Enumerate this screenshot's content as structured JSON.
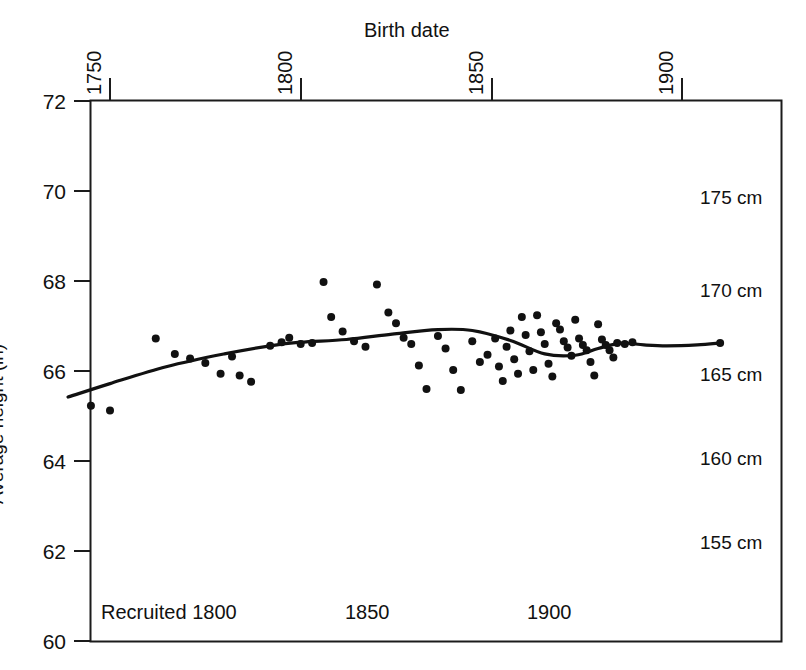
{
  "figure": {
    "background": "#ffffff",
    "ink_color": "#111111",
    "width": 806,
    "height": 670
  },
  "axes": {
    "top_axis_title": "Birth date",
    "left_axis_title": "Average height (in)",
    "x_ticks": [
      "1750",
      "1800",
      "1850",
      "1900"
    ],
    "y_ticks": [
      "72",
      "70",
      "68",
      "66",
      "64",
      "62",
      "60"
    ],
    "right_cm_labels": [
      "175 cm",
      "170 cm",
      "165 cm",
      "160 cm",
      "155 cm"
    ],
    "bottom_recruit_labels": [
      "Recruited 1800",
      "1850",
      "1900"
    ]
  },
  "chart_data": {
    "type": "scatter",
    "title": "Birth date",
    "xlabel": "Birth date",
    "ylabel": "Average height (in)",
    "xlim": [
      1738,
      1914
    ],
    "ylim": [
      60,
      72
    ],
    "grid": false,
    "legend": null,
    "x_tick_values": [
      1750,
      1800,
      1850,
      1900
    ],
    "y_tick_values": [
      60,
      62,
      64,
      66,
      68,
      70,
      72
    ],
    "secondary_y_axis": {
      "label_suffix": "cm",
      "tick_values_cm": [
        175,
        170,
        165,
        160,
        155
      ],
      "tick_values_in": [
        68.9,
        66.93,
        64.96,
        62.99,
        61.02
      ]
    },
    "secondary_x_axis": {
      "name": "Recruited",
      "tick_values": [
        1800,
        1850,
        1900
      ],
      "tick_labels": [
        "Recruited 1800",
        "1850",
        "1900"
      ]
    },
    "series": [
      {
        "name": "Average height observations",
        "type": "scatter",
        "marker": "filled-circle",
        "points": [
          [
            1745,
            65.23
          ],
          [
            1750,
            65.12
          ],
          [
            1762,
            66.72
          ],
          [
            1767,
            66.38
          ],
          [
            1771,
            66.28
          ],
          [
            1775,
            66.18
          ],
          [
            1779,
            65.94
          ],
          [
            1782,
            66.32
          ],
          [
            1784,
            65.9
          ],
          [
            1787,
            65.76
          ],
          [
            1792,
            66.56
          ],
          [
            1795,
            66.64
          ],
          [
            1797,
            66.74
          ],
          [
            1800,
            66.6
          ],
          [
            1803,
            66.62
          ],
          [
            1806,
            67.98
          ],
          [
            1808,
            67.2
          ],
          [
            1811,
            66.88
          ],
          [
            1814,
            66.66
          ],
          [
            1817,
            66.54
          ],
          [
            1820,
            67.92
          ],
          [
            1823,
            67.3
          ],
          [
            1825,
            67.06
          ],
          [
            1827,
            66.74
          ],
          [
            1829,
            66.6
          ],
          [
            1831,
            66.12
          ],
          [
            1833,
            65.6
          ],
          [
            1836,
            66.78
          ],
          [
            1838,
            66.5
          ],
          [
            1840,
            66.02
          ],
          [
            1842,
            65.58
          ],
          [
            1845,
            66.66
          ],
          [
            1847,
            66.2
          ],
          [
            1849,
            66.36
          ],
          [
            1851,
            66.72
          ],
          [
            1852,
            66.1
          ],
          [
            1853,
            65.78
          ],
          [
            1854,
            66.54
          ],
          [
            1855,
            66.9
          ],
          [
            1856,
            66.26
          ],
          [
            1857,
            65.94
          ],
          [
            1858,
            67.2
          ],
          [
            1859,
            66.8
          ],
          [
            1860,
            66.44
          ],
          [
            1861,
            66.02
          ],
          [
            1862,
            67.24
          ],
          [
            1863,
            66.86
          ],
          [
            1864,
            66.6
          ],
          [
            1865,
            66.16
          ],
          [
            1866,
            65.88
          ],
          [
            1867,
            67.06
          ],
          [
            1868,
            66.92
          ],
          [
            1869,
            66.66
          ],
          [
            1870,
            66.52
          ],
          [
            1871,
            66.34
          ],
          [
            1872,
            67.14
          ],
          [
            1873,
            66.72
          ],
          [
            1874,
            66.58
          ],
          [
            1875,
            66.46
          ],
          [
            1876,
            66.2
          ],
          [
            1877,
            65.9
          ],
          [
            1878,
            67.04
          ],
          [
            1879,
            66.7
          ],
          [
            1880,
            66.58
          ],
          [
            1881,
            66.46
          ],
          [
            1882,
            66.3
          ],
          [
            1883,
            66.62
          ],
          [
            1885,
            66.6
          ],
          [
            1887,
            66.64
          ]
        ]
      },
      {
        "name": "Smoothed trend",
        "type": "line",
        "points": [
          [
            1739,
            65.42
          ],
          [
            1750,
            65.72
          ],
          [
            1765,
            66.1
          ],
          [
            1780,
            66.38
          ],
          [
            1792,
            66.56
          ],
          [
            1800,
            66.64
          ],
          [
            1812,
            66.7
          ],
          [
            1824,
            66.82
          ],
          [
            1836,
            66.92
          ],
          [
            1845,
            66.9
          ],
          [
            1855,
            66.68
          ],
          [
            1864,
            66.38
          ],
          [
            1872,
            66.35
          ],
          [
            1878,
            66.5
          ],
          [
            1884,
            66.62
          ],
          [
            1890,
            66.58
          ],
          [
            1896,
            66.56
          ],
          [
            1904,
            66.58
          ],
          [
            1910,
            66.62
          ]
        ],
        "end_marker": "filled-circle"
      }
    ]
  }
}
